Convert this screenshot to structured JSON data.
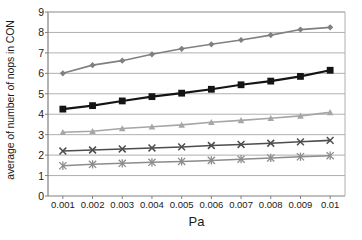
{
  "chart_data": {
    "type": "line",
    "title": "",
    "xlabel": "Pa",
    "ylabel": "average of number of nops in CON",
    "x": [
      0.001,
      0.002,
      0.003,
      0.004,
      0.005,
      0.006,
      0.007,
      0.008,
      0.009,
      0.01
    ],
    "xticklabels": [
      "0.001",
      "0.002",
      "0.003",
      "0.004",
      "0.005",
      "0.006",
      "0.007",
      "0.008",
      "0.009",
      "0.01"
    ],
    "yticklabels": [
      "0",
      "1",
      "2",
      "3",
      "4",
      "5",
      "6",
      "7",
      "8",
      "9"
    ],
    "yticks": [
      0,
      1,
      2,
      3,
      4,
      5,
      6,
      7,
      8,
      9
    ],
    "ylim": [
      0,
      9
    ],
    "grid": "horizontal",
    "legend": "none",
    "series": [
      {
        "name": "series-1",
        "marker": "diamond",
        "color": "#808080",
        "values": [
          6.0,
          6.4,
          6.62,
          6.93,
          7.2,
          7.42,
          7.63,
          7.87,
          8.14,
          8.25
        ]
      },
      {
        "name": "series-2",
        "marker": "square",
        "color": "#141414",
        "values": [
          4.25,
          4.42,
          4.65,
          4.86,
          5.03,
          5.22,
          5.44,
          5.62,
          5.85,
          6.15
        ]
      },
      {
        "name": "series-3",
        "marker": "triangle",
        "color": "#a6a6a6",
        "values": [
          3.12,
          3.17,
          3.3,
          3.39,
          3.48,
          3.61,
          3.7,
          3.8,
          3.92,
          4.09
        ]
      },
      {
        "name": "series-4",
        "marker": "x",
        "color": "#4d4d4d",
        "values": [
          2.2,
          2.25,
          2.3,
          2.35,
          2.4,
          2.47,
          2.52,
          2.58,
          2.65,
          2.72
        ]
      },
      {
        "name": "series-5",
        "marker": "asterisk",
        "color": "#8c8c8c",
        "values": [
          1.48,
          1.55,
          1.6,
          1.65,
          1.69,
          1.74,
          1.8,
          1.86,
          1.92,
          1.97
        ]
      }
    ]
  }
}
